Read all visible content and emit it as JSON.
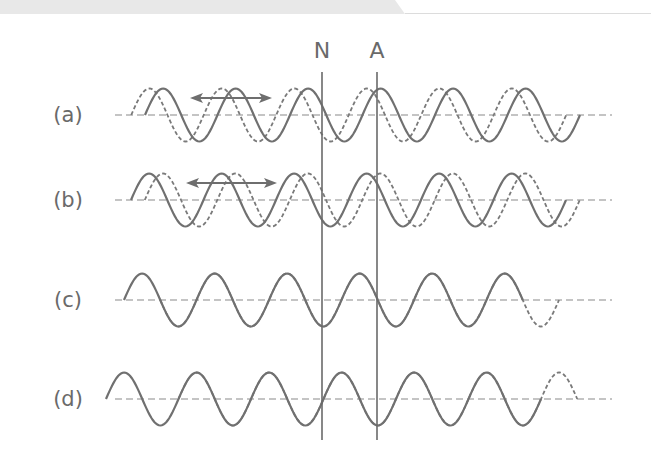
{
  "markers": [
    {
      "id": "node",
      "label": "N"
    },
    {
      "id": "antinode",
      "label": "A"
    }
  ],
  "rows": [
    {
      "label": "(a)",
      "description": "Dashed wave leads solid wave by a small phase; double-headed arrow indicates traveling waves",
      "has_arrow": true,
      "solid": {
        "start_phase": 0,
        "cycles": 6.0
      },
      "dashed": {
        "start_phase": 0,
        "cycles": 6.0,
        "offset_wavelength": -0.19
      }
    },
    {
      "label": "(b)",
      "description": "Dashed wave lags solid wave by a small phase; double-headed arrow indicates traveling waves",
      "has_arrow": true,
      "solid": {
        "start_phase": 0,
        "cycles": 6.0
      },
      "dashed": {
        "start_phase": 0,
        "cycles": 6.0,
        "offset_wavelength": 0.19
      }
    },
    {
      "label": "(c)",
      "description": "Solid and dashed waves are exactly out of phase (inverted)",
      "has_arrow": false,
      "solid": {
        "start_phase": 0,
        "cycles": 5.5
      },
      "dashed": {
        "start_phase": 0.5,
        "cycles": 5.5,
        "offset_wavelength": 0.5
      }
    },
    {
      "label": "(d)",
      "description": "Solid and dashed waves are nearly in phase",
      "has_arrow": false,
      "solid": {
        "start_phase": 0,
        "cycles": 6.0
      },
      "dashed": {
        "start_phase": 0,
        "cycles": 5.5,
        "offset_wavelength": 1.0
      }
    }
  ],
  "colors": {
    "line": "#707070",
    "text": "#6a6a6a",
    "banner": "#e6e6e6"
  }
}
